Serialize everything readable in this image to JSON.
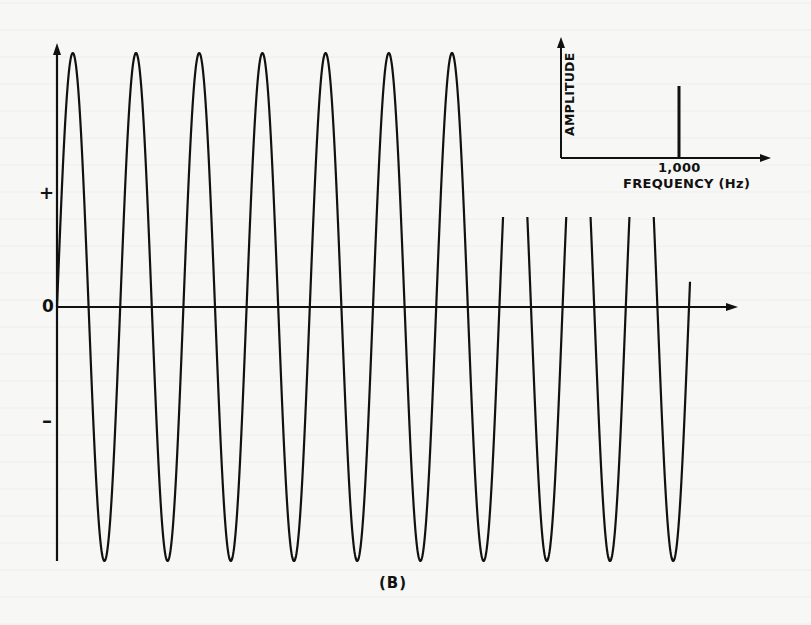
{
  "figure": {
    "caption": "(B)",
    "main_plot": {
      "y_labels": {
        "positive": "+",
        "zero": "0",
        "negative": "–"
      }
    },
    "inset": {
      "ylabel": "AMPLITUDE",
      "xlabel": "FREQUENCY (Hz)",
      "tick_label": "1,000"
    }
  },
  "chart_data": [
    {
      "type": "line",
      "title": "Pure tone waveform (time domain)",
      "xlabel": "",
      "ylabel": "",
      "y_tick_labels": [
        "+",
        "0",
        "–"
      ],
      "waveform": "sine",
      "cycles_shown": 10,
      "start_phase": "0 (starts at zero, rising)",
      "amplitude_relative": 1.0,
      "ylim": [
        -1,
        1
      ],
      "grid": false,
      "note": "Peaks 8-10 partially hidden behind inset spectrum plot"
    },
    {
      "type": "bar",
      "title": "Spectrum (frequency domain)",
      "xlabel": "FREQUENCY (Hz)",
      "ylabel": "AMPLITUDE",
      "categories": [
        "1,000"
      ],
      "x": [
        1000
      ],
      "values": [
        1
      ],
      "x_tick_labels": [
        "1,000"
      ],
      "grid": false
    }
  ],
  "geometry": {
    "origin_x": 57,
    "zero_y": 307,
    "amplitude_px": 254,
    "period_px": 63.2,
    "end_x": 691,
    "clip_top_after_x": 470,
    "clip_top_y": 217
  }
}
